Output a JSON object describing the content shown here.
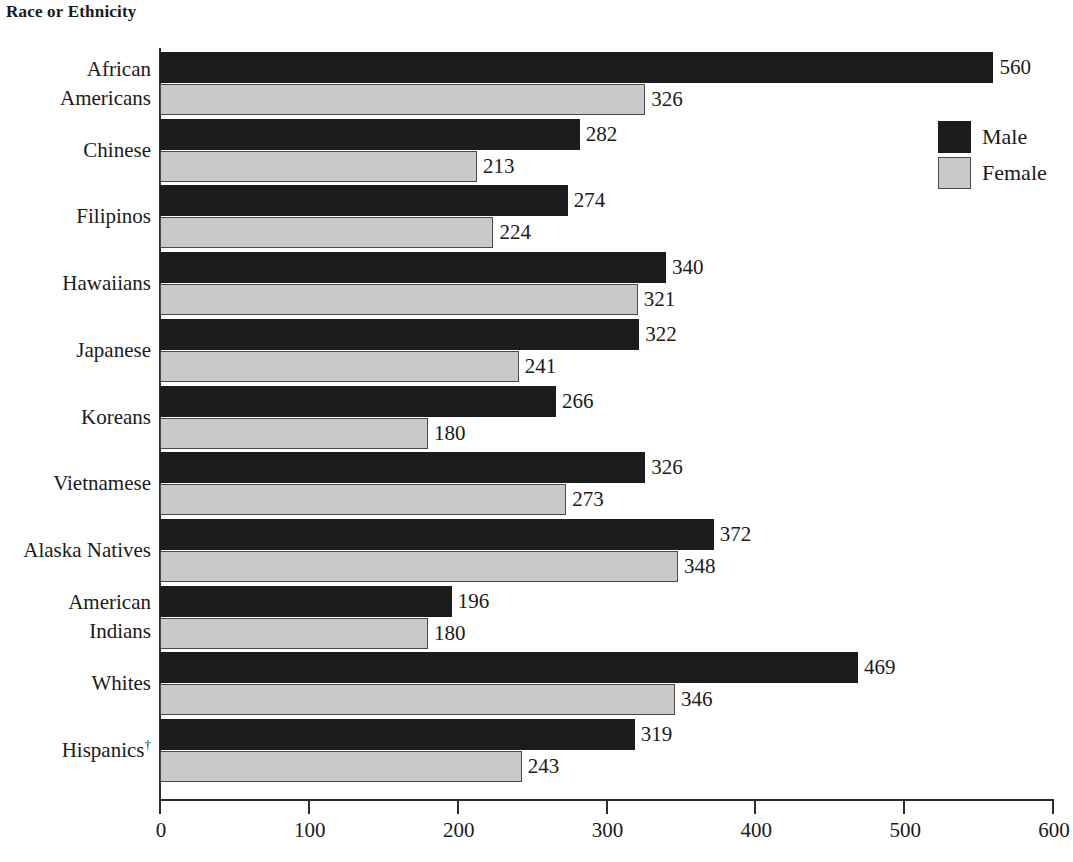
{
  "chart_data": {
    "type": "bar",
    "orientation": "horizontal",
    "title": "Race or Ethnicity",
    "xlabel": "",
    "ylabel": "",
    "xlim": [
      0,
      600
    ],
    "xticks": [
      0,
      100,
      200,
      300,
      400,
      500,
      600
    ],
    "xtick_labels": [
      "0",
      "100",
      "200",
      "300",
      "400",
      "500",
      "600"
    ],
    "grid": false,
    "legend_position": "top-right",
    "categories": [
      "African Americans",
      "Chinese",
      "Filipinos",
      "Hawaiians",
      "Japanese",
      "Koreans",
      "Vietnamese",
      "Alaska Natives",
      "American Indians",
      "Whites",
      "Hispanics†"
    ],
    "category_lines": [
      [
        "African",
        "Americans"
      ],
      [
        "Chinese"
      ],
      [
        "Filipinos"
      ],
      [
        "Hawaiians"
      ],
      [
        "Japanese"
      ],
      [
        "Koreans"
      ],
      [
        "Vietnamese"
      ],
      [
        "Alaska Natives"
      ],
      [
        "American",
        "Indians"
      ],
      [
        "Whites"
      ],
      [
        "Hispanics†"
      ]
    ],
    "series": [
      {
        "name": "Male",
        "color": "#1c1c1c",
        "values": [
          560,
          282,
          274,
          340,
          322,
          266,
          326,
          372,
          196,
          469,
          319
        ]
      },
      {
        "name": "Female",
        "color": "#c9c9c9",
        "values": [
          326,
          213,
          224,
          321,
          241,
          180,
          273,
          348,
          180,
          346,
          243
        ]
      }
    ],
    "data_labels": {
      "male": [
        "560",
        "282",
        "274",
        "340",
        "322",
        "266",
        "326",
        "372",
        "196",
        "469",
        "319"
      ],
      "female": [
        "326",
        "213",
        "224",
        "321",
        "241",
        "180",
        "273",
        "348",
        "180",
        "346",
        "243"
      ]
    }
  },
  "legend": {
    "items": [
      {
        "label": "Male",
        "swatch": "male-swatch"
      },
      {
        "label": "Female",
        "swatch": "female-swatch"
      }
    ]
  },
  "colors": {
    "male": "#1c1c1c",
    "female": "#c9c9c9",
    "axis": "#2b2b2b",
    "text": "#1a1a1a",
    "background": "#ffffff"
  }
}
